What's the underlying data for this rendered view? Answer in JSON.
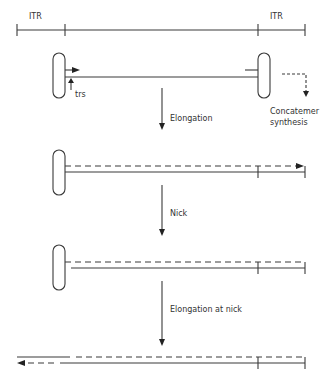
{
  "diagram": {
    "type": "flow",
    "colors": {
      "line": "#3a3a3a",
      "text": "#333333",
      "background": "#ffffff"
    },
    "top_scale": {
      "left_label": "ITR",
      "right_label": "ITR"
    },
    "stage1": {
      "trs_label": "trs",
      "side_label_line1": "Concatemer",
      "side_label_line2": "synthesis"
    },
    "steps": [
      {
        "label": "Elongation"
      },
      {
        "label": "Nick"
      },
      {
        "label": "Elongation at nick"
      }
    ]
  }
}
